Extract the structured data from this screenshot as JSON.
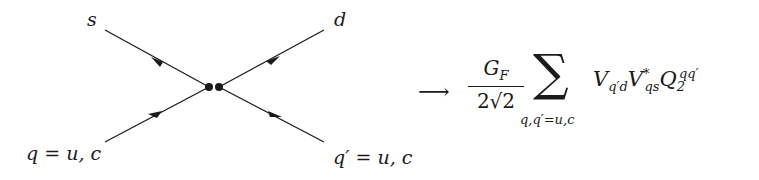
{
  "diagram": {
    "type": "four-fermion-vertex",
    "labels": {
      "top_left": "s",
      "top_right": "d",
      "bottom_left": "q = u, c",
      "bottom_right": "q′ = u, c"
    },
    "lines": [
      {
        "from": "vertex",
        "to": "s",
        "arrow": "toward-s"
      },
      {
        "from": "d",
        "to": "vertex",
        "arrow": "toward-vertex"
      },
      {
        "from": "q",
        "to": "vertex",
        "arrow": "toward-vertex"
      },
      {
        "from": "vertex",
        "to": "q′",
        "arrow": "toward-q′"
      }
    ],
    "vertex_dots": 2
  },
  "formula": {
    "arrow": "⟶",
    "fraction_numerator": "G",
    "fraction_numerator_sub": "F",
    "fraction_denominator": "2√2",
    "sum_symbol": "∑",
    "sum_subscript": "q,q′=u,c",
    "term1": "V",
    "term1_sub": "q′d",
    "term2": "V",
    "term2_sup": "*",
    "term2_sub": "qs",
    "term3": "Q",
    "term3_sub": "2",
    "term3_sup": "qq′"
  }
}
